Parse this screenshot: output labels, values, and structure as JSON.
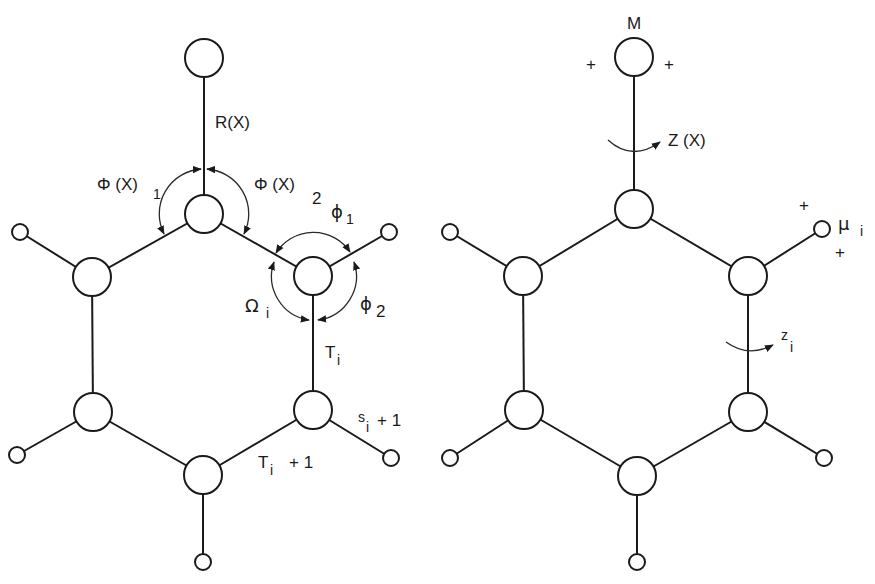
{
  "colors": {
    "ink": "#1a1a1a",
    "background": "#ffffff"
  },
  "left_diagram": {
    "labels": {
      "bond_length": "R(X)",
      "angle1_main": "Φ (X)",
      "angle1_sub": "1",
      "angle2_main": "Φ (X)",
      "angle2_sub": "2",
      "phi1_main": "ϕ",
      "phi1_sub": "1",
      "phi2_main": "ϕ",
      "phi2_sub": "2",
      "omega_main": "Ω",
      "omega_sub": "i",
      "t_main": "T",
      "t_sub": "i",
      "s_pre": "s",
      "s_sub": "i",
      "s_post": "+ 1",
      "t_next_main": "T",
      "t_next_sub": "i",
      "t_next_post": "+ 1"
    }
  },
  "right_diagram": {
    "labels": {
      "mass": "M",
      "plus_left": "+",
      "plus_right": "+",
      "torsion_main": "Z (X)",
      "mu_main": "μ",
      "mu_sub": "i",
      "mu_plus_top": "+",
      "mu_plus_bottom": "+",
      "z_main": "z",
      "z_sub": "i"
    }
  }
}
